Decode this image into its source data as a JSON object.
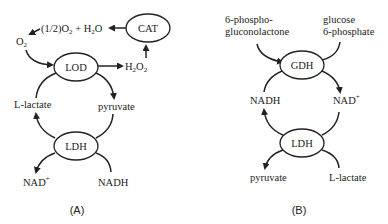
{
  "panelA": {
    "caption": "(A)",
    "enzymes": {
      "lod": "LOD",
      "cat": "CAT",
      "ldh": "LDH"
    },
    "labels": {
      "o2": "O",
      "o2_sub": "2",
      "half": "(1/2)O",
      "half_sub": "2",
      "plus_h2o": " + H",
      "h2o_sub": "2",
      "h2o_o": "O",
      "h2o2_h": "H",
      "h2o2_sub1": "2",
      "h2o2_o": "O",
      "h2o2_sub2": "2",
      "lactate": "L-lactate",
      "pyruvate": "pyruvate",
      "nad": "NAD",
      "nad_sup": "+",
      "nadh": "NADH"
    }
  },
  "panelB": {
    "caption": "(B)",
    "enzymes": {
      "gdh": "GDH",
      "ldh": "LDH"
    },
    "labels": {
      "phospho_line1": "6-phospho-",
      "phospho_line2": "gluconolactone",
      "glucose_line1": "glucose",
      "glucose_line2": "6-phosphate",
      "nadh": "NADH",
      "nad": "NAD",
      "nad_sup": "+",
      "pyruvate": "pyruvate",
      "lactate": "L-lactate"
    }
  }
}
